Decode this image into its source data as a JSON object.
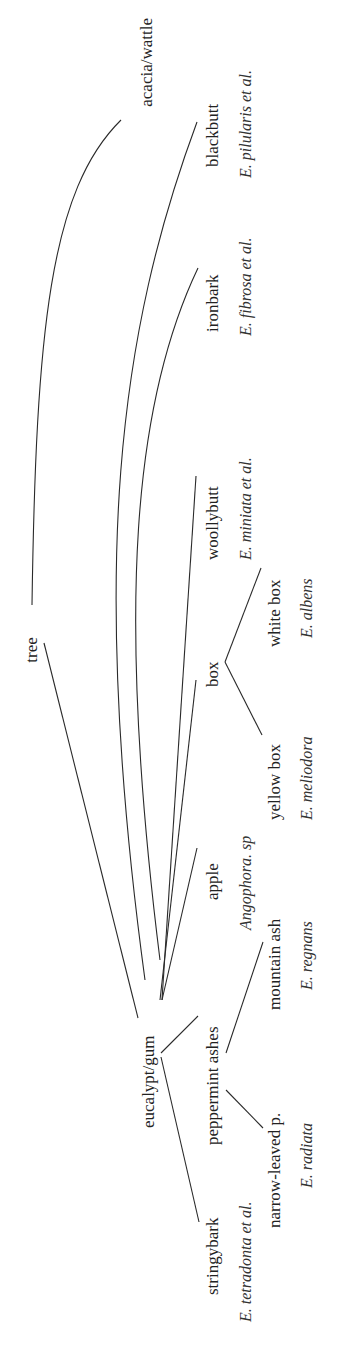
{
  "diagram": {
    "type": "taxonomy-tree",
    "orientation": "rotated-90-ccw",
    "nodes": {
      "tree": {
        "label": "tree"
      },
      "acacia": {
        "label": "acacia/wattle"
      },
      "eucalypt": {
        "label": "eucalypt/gum"
      },
      "blackbutt": {
        "label": "blackbutt",
        "sci": "E. pilularis et al."
      },
      "ironbark": {
        "label": "ironbark",
        "sci": "E. fibrosa et al."
      },
      "woollybutt": {
        "label": "woollybutt",
        "sci": "E. miniata et al."
      },
      "box": {
        "label": "box"
      },
      "whitebox": {
        "label": "white box",
        "sci": "E. albens"
      },
      "yellowbox": {
        "label": "yellow box",
        "sci": "E. meliodora"
      },
      "apple": {
        "label": "apple",
        "sci": "Angophora. sp"
      },
      "ashes": {
        "label": "peppermint ashes"
      },
      "mountainash": {
        "label": "mountain ash",
        "sci": "E. regnans"
      },
      "narrowleaved": {
        "label": "narrow-leaved p.",
        "sci": "E. radiata"
      },
      "stringybark": {
        "label": "stringybark",
        "sci": "E. tetradonta et al."
      }
    },
    "edges": [
      [
        "tree",
        "acacia"
      ],
      [
        "tree",
        "eucalypt"
      ],
      [
        "eucalypt",
        "blackbutt"
      ],
      [
        "eucalypt",
        "ironbark"
      ],
      [
        "eucalypt",
        "woollybutt"
      ],
      [
        "eucalypt",
        "box"
      ],
      [
        "eucalypt",
        "apple"
      ],
      [
        "eucalypt",
        "ashes"
      ],
      [
        "eucalypt",
        "stringybark"
      ],
      [
        "box",
        "whitebox"
      ],
      [
        "box",
        "yellowbox"
      ],
      [
        "ashes",
        "mountainash"
      ],
      [
        "ashes",
        "narrowleaved"
      ]
    ],
    "colors": {
      "line": "#2a2a2a",
      "text": "#222222",
      "sci_text": "#333333"
    }
  }
}
